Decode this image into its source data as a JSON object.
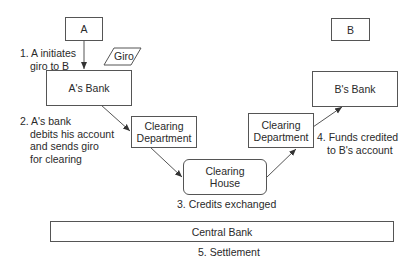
{
  "nodes": {
    "a": "A",
    "b": "B",
    "a_bank": "A's Bank",
    "b_bank": "B's Bank",
    "clearing_dept_left": [
      "Clearing",
      "Department"
    ],
    "clearing_dept_right": [
      "Clearing",
      "Department"
    ],
    "clearing_house": [
      "Clearing",
      "House"
    ],
    "central_bank": "Central Bank",
    "giro": "Giro"
  },
  "steps": {
    "step1": [
      "1. A initiates",
      "giro to B"
    ],
    "step2": [
      "2. A's bank",
      "debits his account",
      "and sends giro",
      "for clearing"
    ],
    "step3": "3. Credits exchanged",
    "step4": [
      "4. Funds credited",
      "to B's account"
    ],
    "step5": "5. Settlement"
  },
  "colors": {
    "stroke": "#555555",
    "text": "#2a2a2a"
  }
}
